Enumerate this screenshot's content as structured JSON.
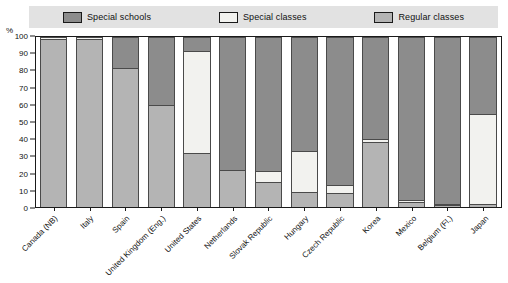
{
  "legend": {
    "items": [
      {
        "label": "Special schools",
        "key": "special_schools",
        "color": "#8c8c8c",
        "icon": "legend-swatch"
      },
      {
        "label": "Special classes",
        "key": "special_classes",
        "color": "#f2f2ef",
        "icon": "legend-swatch"
      },
      {
        "label": "Regular classes",
        "key": "regular_classes",
        "color": "#b4b4b4",
        "icon": "legend-swatch"
      }
    ],
    "background": "#e2e2e2"
  },
  "axis": {
    "y_unit": "%",
    "y_ticks": [
      "100",
      "90",
      "80",
      "70",
      "60",
      "50",
      "40",
      "30",
      "20",
      "10",
      "0"
    ]
  },
  "chart_data": {
    "type": "bar",
    "stacked": true,
    "title": "",
    "xlabel": "",
    "ylabel": "%",
    "ylim": [
      0,
      100
    ],
    "grid": false,
    "legend_position": "top",
    "categories": [
      "Canada (NB)",
      "Italy",
      "Spain",
      "United Kingdom (Eng.)",
      "United States",
      "Netherlands",
      "Slovak Republic",
      "Hungary",
      "Czech Republic",
      "Korea",
      "Mexico",
      "Belgium (Fl.)",
      "Japan"
    ],
    "series": [
      {
        "name": "Special schools",
        "color": "#8c8c8c",
        "values": [
          0,
          0,
          18,
          40,
          8,
          78,
          79,
          67,
          87,
          60,
          96,
          98,
          45
        ]
      },
      {
        "name": "Special classes",
        "color": "#f2f2ef",
        "values": [
          1,
          1,
          0,
          0,
          60,
          0,
          6,
          24,
          5,
          2,
          1,
          1,
          53
        ]
      },
      {
        "name": "Regular classes",
        "color": "#b4b4b4",
        "values": [
          99,
          99,
          82,
          60,
          32,
          22,
          15,
          9,
          8,
          38,
          3,
          1,
          2
        ]
      }
    ]
  }
}
